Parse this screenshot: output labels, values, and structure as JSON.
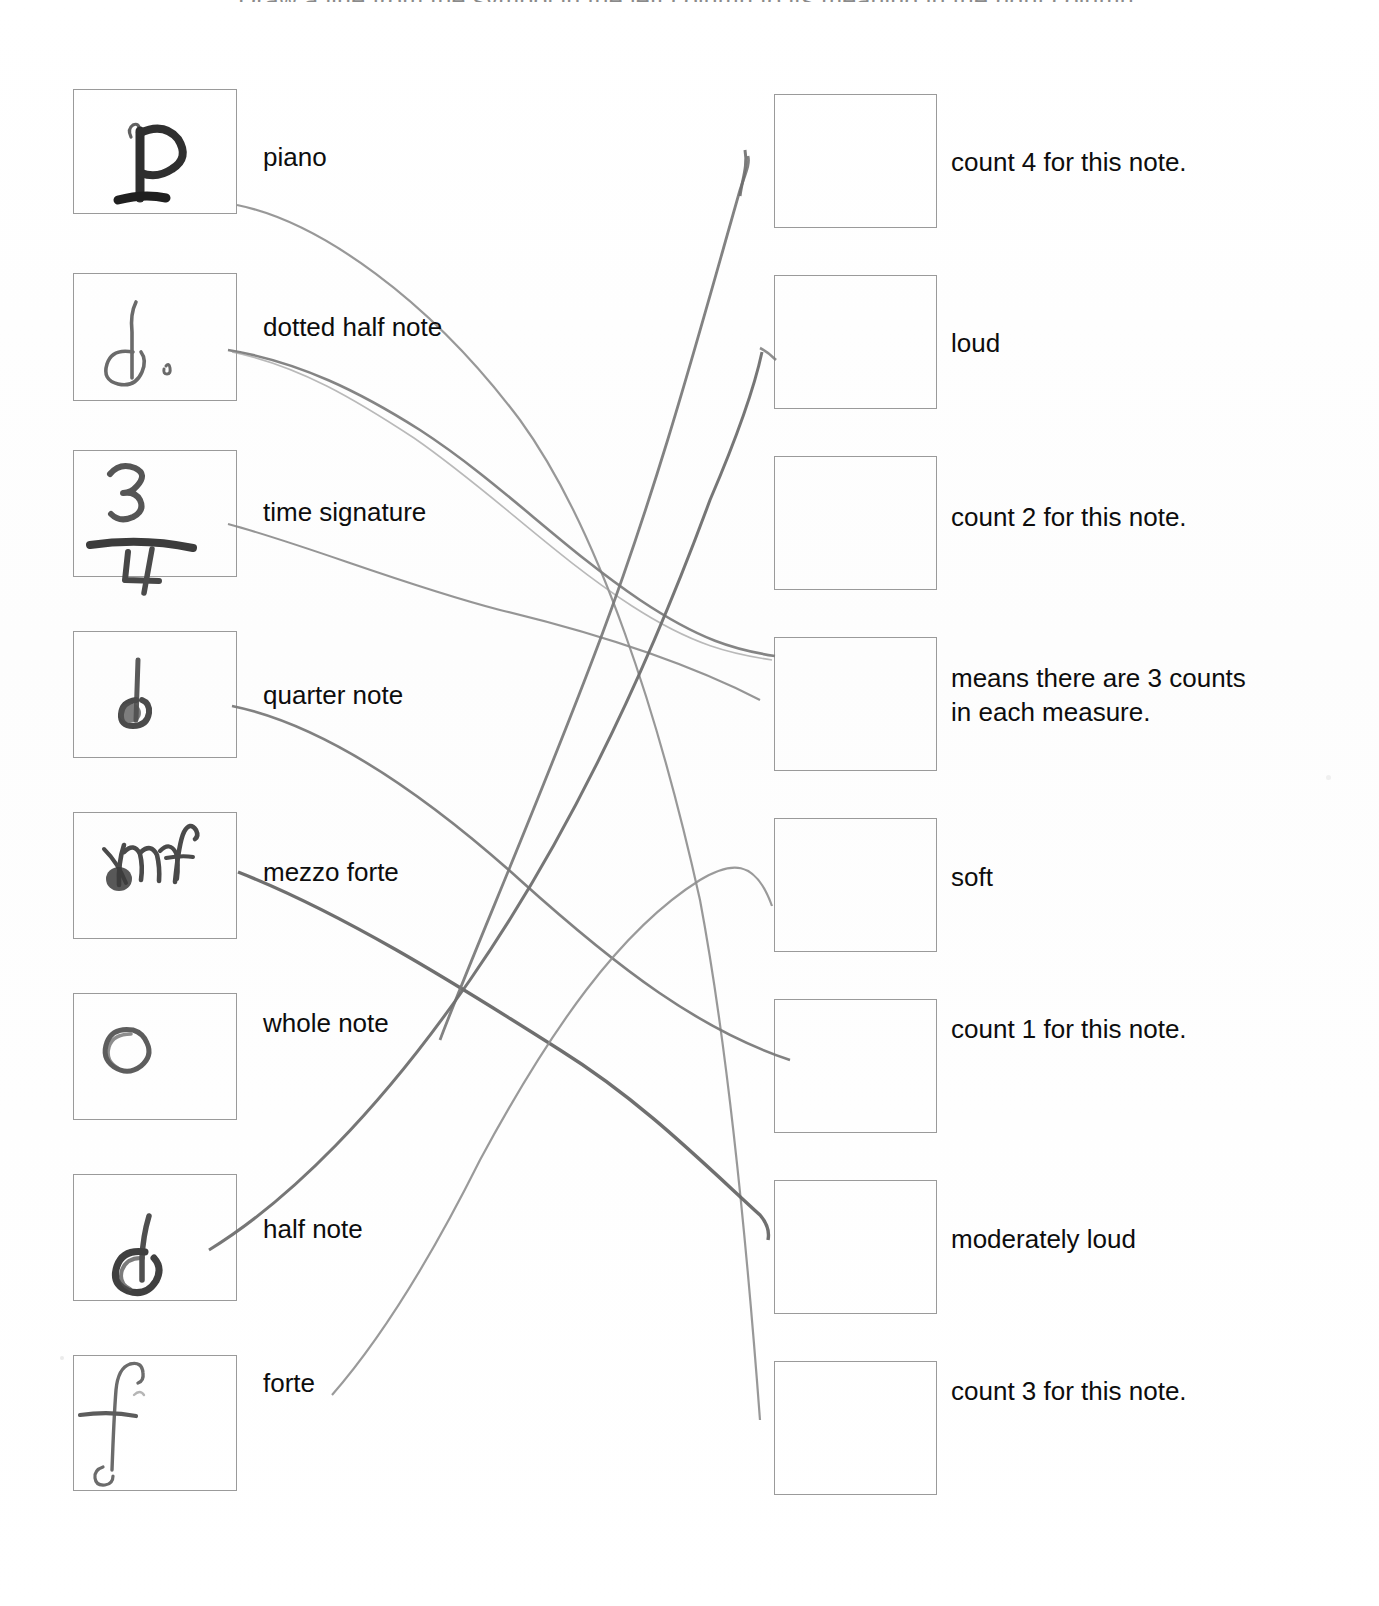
{
  "worksheet": {
    "top_instruction": "Draw a line from the symbol in the left column to its meaning in the right column.",
    "left_column": [
      {
        "label": "piano",
        "symbol": "handwritten-p"
      },
      {
        "label": "dotted half note",
        "symbol": "handwritten-dotted-half-note"
      },
      {
        "label": "time signature",
        "symbol": "handwritten-three-four"
      },
      {
        "label": "quarter note",
        "symbol": "handwritten-quarter-note"
      },
      {
        "label": "mezzo forte",
        "symbol": "handwritten-mf"
      },
      {
        "label": "whole note",
        "symbol": "handwritten-whole-note"
      },
      {
        "label": "half note",
        "symbol": "handwritten-half-note"
      },
      {
        "label": "forte",
        "symbol": "handwritten-f"
      }
    ],
    "right_column": [
      {
        "label": "count 4 for this note."
      },
      {
        "label": "loud"
      },
      {
        "label": "count 2 for this note."
      },
      {
        "label": "means there are 3 counts\nin each measure."
      },
      {
        "label": "soft"
      },
      {
        "label": "count 1 for this note."
      },
      {
        "label": "moderately loud"
      },
      {
        "label": "count 3 for this note."
      }
    ],
    "colors": {
      "box_border": "#9a9a9a",
      "text": "#0d0d0d",
      "pencil_dark": "#6e6e6e",
      "pencil_light": "#a9a9a9",
      "paper": "#ffffff"
    }
  }
}
